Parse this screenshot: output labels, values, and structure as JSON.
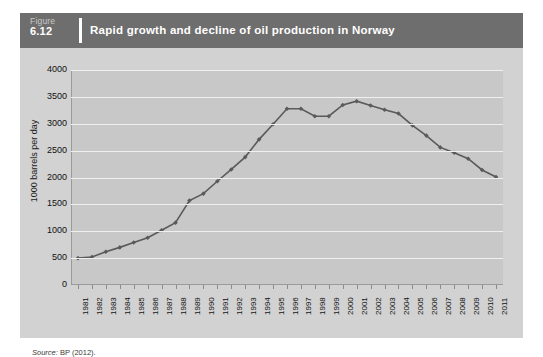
{
  "figure": {
    "label": "Figure",
    "number": "6.12",
    "title": "Rapid growth and decline of oil production in Norway",
    "source_prefix": "Source:",
    "source_text": "BP (2012)."
  },
  "colors": {
    "header_bg": "#6e6e6e",
    "panel_bg": "#d2d2d2",
    "plot_bg": "#c8c8c8",
    "gridline": "#f0f0f0",
    "series_line": "#5a5a5a",
    "title_text": "#ffffff"
  },
  "chart_data": {
    "type": "line",
    "title": "Rapid growth and decline of oil production in Norway",
    "xlabel": "",
    "ylabel": "1000 barrels per day",
    "ylim": [
      0,
      4000
    ],
    "ytick_step": 500,
    "yticks": [
      0,
      500,
      1000,
      1500,
      2000,
      2500,
      3000,
      3500,
      4000
    ],
    "ytick_labels": [
      "0",
      "500",
      "1000",
      "1500",
      "2000",
      "2500",
      "3000",
      "3500",
      "4000"
    ],
    "grid": true,
    "legend": false,
    "markers": true,
    "categories": [
      "1981",
      "1982",
      "1983",
      "1984",
      "1985",
      "1986",
      "1987",
      "1988",
      "1989",
      "1990",
      "1991",
      "1992",
      "1993",
      "1994",
      "1995",
      "1996",
      "1997",
      "1998",
      "1999",
      "2000",
      "2001",
      "2002",
      "2003",
      "2004",
      "2005",
      "2006",
      "2007",
      "2008",
      "2009",
      "2010",
      "2011"
    ],
    "series": [
      {
        "name": "Norway oil production",
        "values": [
          500,
          520,
          620,
          700,
          790,
          880,
          1020,
          1160,
          1570,
          1700,
          1930,
          2150,
          2380,
          2710,
          2990,
          3280,
          3280,
          3140,
          3140,
          3350,
          3420,
          3340,
          3260,
          3190,
          2970,
          2780,
          2560,
          2460,
          2350,
          2140,
          2010
        ]
      }
    ]
  }
}
